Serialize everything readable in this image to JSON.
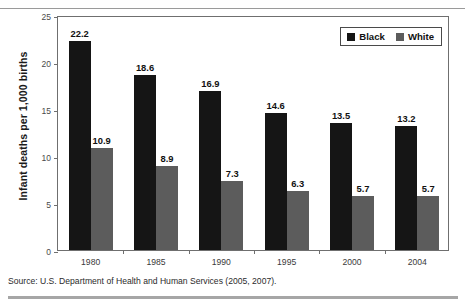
{
  "figure": {
    "source_note": "Source: U.S. Department of Health and Human Services (2005, 2007)."
  },
  "legend": {
    "position": "top-right",
    "items": [
      {
        "label": "Black",
        "color": "#151515"
      },
      {
        "label": "White",
        "color": "#5c5c5c"
      }
    ]
  },
  "chart_data": {
    "type": "bar",
    "title": "",
    "subtitle": "",
    "xlabel": "",
    "ylabel": "Infant deaths per 1,000 births",
    "categories": [
      "1980",
      "1985",
      "1990",
      "1995",
      "2000",
      "2004"
    ],
    "series": [
      {
        "name": "Black",
        "color": "#151515",
        "values": [
          22.2,
          18.6,
          16.9,
          14.6,
          13.5,
          13.2
        ],
        "labels": [
          "22.2",
          "18.6",
          "16.9",
          "14.6",
          "13.5",
          "13.2"
        ]
      },
      {
        "name": "White",
        "color": "#5c5c5c",
        "values": [
          10.9,
          8.9,
          7.3,
          6.3,
          5.7,
          5.7
        ],
        "labels": [
          "10.9",
          "8.9",
          "7.3",
          "6.3",
          "5.7",
          "5.7"
        ]
      }
    ],
    "ylim": [
      0,
      25
    ],
    "yticks": [
      0,
      5,
      10,
      15,
      20,
      25
    ],
    "ytick_labels": [
      "0",
      "5",
      "10",
      "15",
      "20",
      "25"
    ],
    "grid": false,
    "legend_position": "top-right"
  }
}
